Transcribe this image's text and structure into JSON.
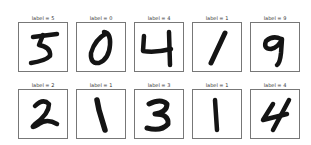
{
  "figure": {
    "rows": 2,
    "cols": 5,
    "title_prefix": "label = ",
    "samples": [
      {
        "label": "5",
        "title": "label = 5",
        "digit": "5"
      },
      {
        "label": "0",
        "title": "label = 0",
        "digit": "0"
      },
      {
        "label": "4",
        "title": "label = 4",
        "digit": "4"
      },
      {
        "label": "1",
        "title": "label = 1",
        "digit": "1"
      },
      {
        "label": "9",
        "title": "label = 9",
        "digit": "9"
      },
      {
        "label": "2",
        "title": "label = 2",
        "digit": "2"
      },
      {
        "label": "1",
        "title": "label = 1",
        "digit": "1"
      },
      {
        "label": "3",
        "title": "label = 3",
        "digit": "3"
      },
      {
        "label": "1",
        "title": "label = 1",
        "digit": "1"
      },
      {
        "label": "4",
        "title": "label = 4",
        "digit": "4"
      }
    ]
  },
  "colors": {
    "ink": "#141414",
    "frame": "#777777",
    "background": "#ffffff"
  }
}
